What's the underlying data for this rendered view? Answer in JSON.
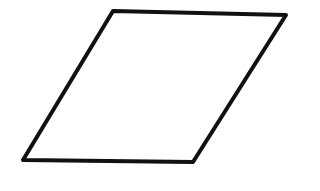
{
  "diagram": {
    "shape": "parallelogram",
    "stroke_color": "#111111",
    "fill_color": "#ffffff",
    "stroke_width": 4,
    "points": [
      [
        113,
        11
      ],
      [
        286,
        15
      ],
      [
        193,
        162
      ],
      [
        23,
        160
      ]
    ]
  }
}
